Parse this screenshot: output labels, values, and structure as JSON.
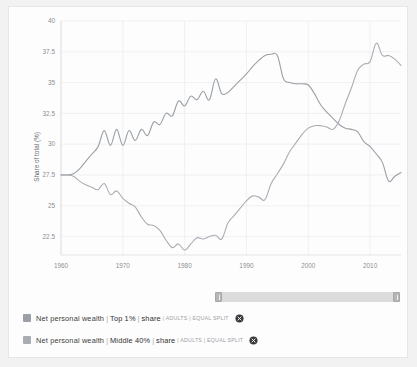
{
  "chart_data": {
    "type": "line",
    "title": "",
    "xlabel": "",
    "ylabel": "Share of total (%)",
    "xlim": [
      1960,
      2015
    ],
    "ylim": [
      21.0,
      40.0
    ],
    "ytick_labels": [
      "40",
      "37.5",
      "35",
      "32.5",
      "30",
      "27.5",
      "25",
      "22.5"
    ],
    "ytick_values": [
      40,
      37.5,
      35,
      32.5,
      30,
      27.5,
      25,
      22.5
    ],
    "xtick_labels": [
      "1960",
      "1970",
      "1980",
      "1990",
      "2000",
      "2010"
    ],
    "xtick_values": [
      1960,
      1970,
      1980,
      1990,
      2000,
      2010
    ],
    "grid": true,
    "legend_position": "bottom",
    "x": [
      1960,
      1961,
      1962,
      1963,
      1964,
      1965,
      1966,
      1967,
      1968,
      1969,
      1970,
      1971,
      1972,
      1973,
      1974,
      1975,
      1976,
      1977,
      1978,
      1979,
      1980,
      1981,
      1982,
      1983,
      1984,
      1985,
      1986,
      1987,
      1988,
      1989,
      1990,
      1991,
      1992,
      1993,
      1994,
      1995,
      1996,
      1997,
      1998,
      1999,
      2000,
      2001,
      2002,
      2003,
      2004,
      2005,
      2006,
      2007,
      2008,
      2009,
      2010,
      2011,
      2012,
      2013,
      2014,
      2015
    ],
    "series": [
      {
        "name": "Net personal wealth | Top 1% | share",
        "color": "#9aa0a6",
        "values": [
          27.5,
          27.5,
          27.6,
          28.0,
          28.6,
          29.2,
          29.8,
          31.1,
          29.9,
          31.2,
          29.9,
          31.1,
          30.3,
          31.2,
          30.7,
          31.8,
          31.6,
          32.5,
          32.3,
          33.5,
          33.1,
          33.9,
          33.6,
          34.3,
          33.6,
          35.3,
          34.1,
          34.2,
          34.7,
          35.2,
          35.7,
          36.3,
          36.8,
          37.2,
          37.3,
          37.2,
          35.3,
          35.0,
          34.9,
          34.9,
          34.8,
          34.1,
          33.2,
          32.6,
          32.1,
          31.6,
          31.3,
          31.2,
          31.0,
          30.2,
          29.8,
          29.2,
          28.5,
          27.0,
          27.4,
          27.7
        ]
      },
      {
        "name": "Net personal wealth | Middle 40% | share",
        "color": "#a9adb3",
        "values": [
          27.5,
          27.5,
          27.4,
          27.0,
          26.7,
          26.5,
          26.3,
          26.8,
          25.9,
          26.2,
          25.6,
          25.2,
          24.9,
          24.1,
          23.5,
          23.4,
          23.0,
          22.2,
          21.6,
          21.9,
          21.4,
          21.9,
          22.4,
          22.3,
          22.5,
          22.6,
          22.3,
          23.6,
          24.2,
          24.8,
          25.4,
          25.8,
          25.7,
          25.5,
          26.8,
          27.6,
          28.4,
          29.4,
          30.1,
          30.8,
          31.3,
          31.5,
          31.5,
          31.4,
          31.2,
          31.9,
          33.3,
          34.6,
          36.0,
          36.5,
          36.7,
          38.2,
          37.2,
          37.2,
          36.9,
          36.4
        ]
      }
    ]
  },
  "legend": {
    "items": [
      {
        "base": "Net personal wealth",
        "sep1": "|",
        "group": "Top 1%",
        "sep2": "|",
        "metric": "share",
        "meta": "| ADULTS | EQUAL SPLIT",
        "swatch_color": "#9aa0a6",
        "close_label": "remove-series"
      },
      {
        "base": "Net personal wealth",
        "sep1": "|",
        "group": "Middle 40%",
        "sep2": "|",
        "metric": "share",
        "meta": "| ADULTS | EQUAL SPLIT",
        "swatch_color": "#a9adb3",
        "close_label": "remove-series"
      }
    ]
  },
  "range_slider": {
    "left_handle": "‖",
    "right_handle": "‖"
  },
  "colors": {
    "panel_background": "#fdfdfd",
    "page_background": "#f2f2f2",
    "grid": "#e9e9ed",
    "axis_text": "#8f8f93"
  }
}
